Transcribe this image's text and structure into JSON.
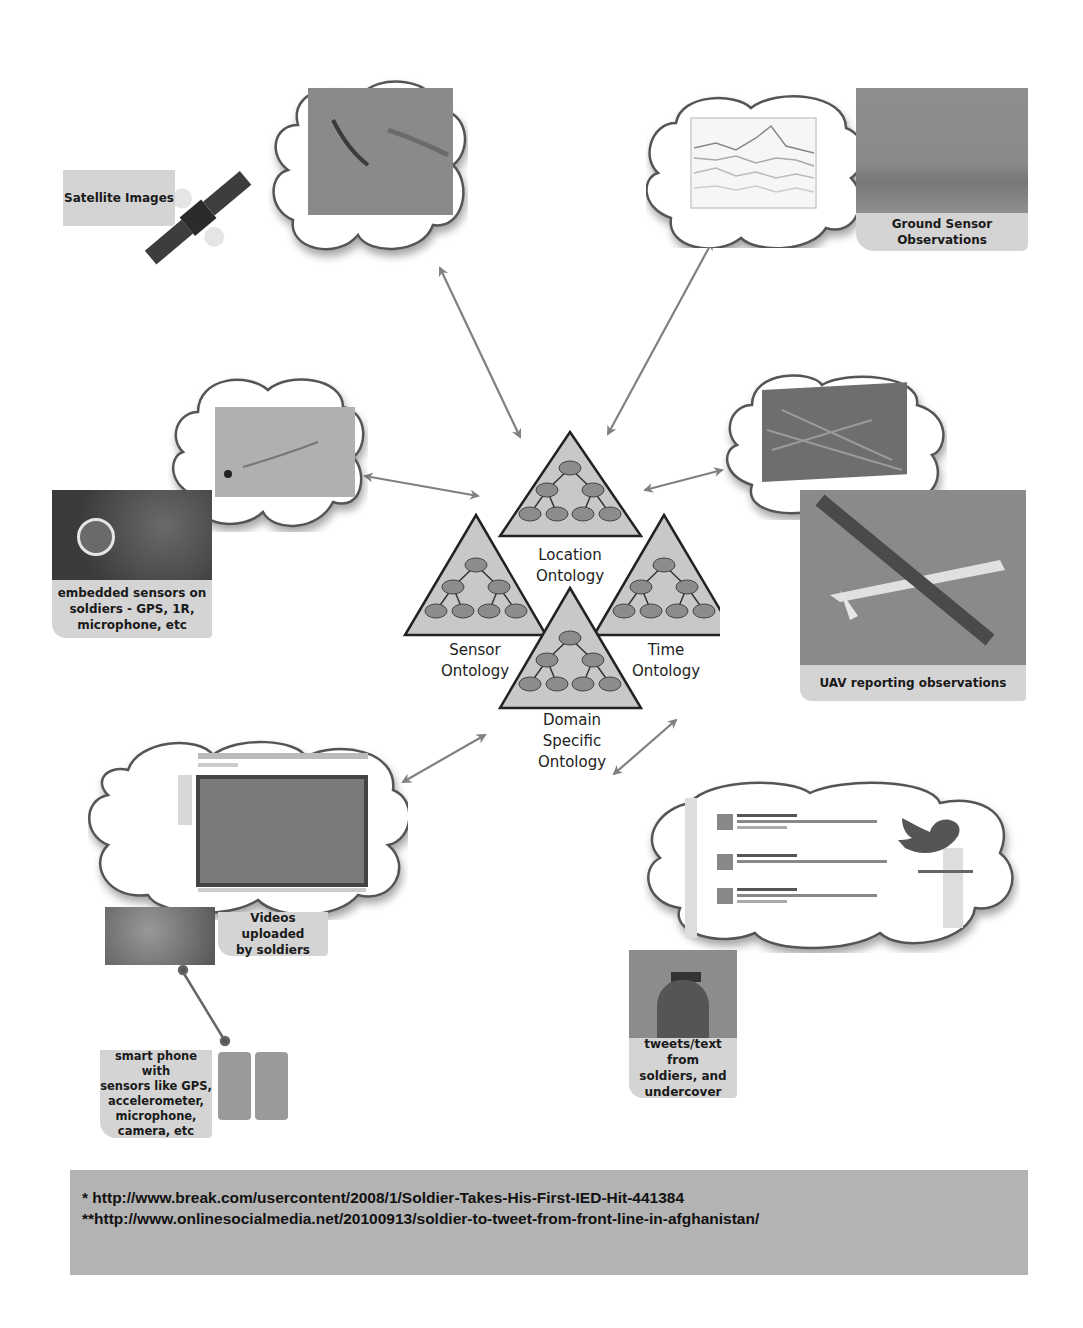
{
  "diagram": {
    "center": {
      "ontologies": [
        {
          "id": "location",
          "label_line1": "Location",
          "label_line2": "Ontology"
        },
        {
          "id": "sensor",
          "label_line1": "Sensor",
          "label_line2": "Ontology"
        },
        {
          "id": "time",
          "label_line1": "Time",
          "label_line2": "Ontology"
        },
        {
          "id": "domain",
          "label_line1": "Domain",
          "label_line2": "Specific",
          "label_line3": "Ontology"
        }
      ]
    },
    "sources": {
      "satellite": {
        "label": "Satellite Images"
      },
      "ground_sensor": {
        "label": "Ground Sensor Observations"
      },
      "embedded": {
        "label_line1": "embedded sensors on",
        "label_line2": "soldiers - GPS, 1R,",
        "label_line3": "microphone, etc"
      },
      "uav": {
        "label": "UAV reporting observations"
      },
      "videos": {
        "label_line1": "Videos uploaded",
        "label_line2": "by soldiers"
      },
      "smartphone": {
        "label_line1": "smart phone with",
        "label_line2": "sensors like GPS,",
        "label_line3": "accelerometer,",
        "label_line4": "microphone,",
        "label_line5": "camera, etc"
      },
      "tweets": {
        "label_line1": "tweets/text from",
        "label_line2": "soldiers, and",
        "label_line3": "undercover"
      }
    },
    "colors": {
      "triangle_fill": "#c8c8c8",
      "node_fill": "#8c8c8c",
      "arrow": "#808080",
      "label_bg": "#d4d4d4",
      "footer_bg": "#b3b3b3"
    }
  },
  "footer": {
    "ref1": "* http://www.break.com/usercontent/2008/1/Soldier-Takes-His-First-IED-Hit-441384",
    "ref2": "**http://www.onlinesocialmedia.net/20100913/soldier-to-tweet-from-front-line-in-afghanistan/"
  }
}
